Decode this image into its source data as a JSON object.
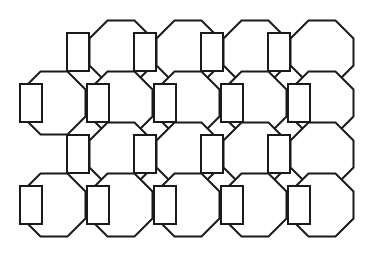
{
  "figure": {
    "name": "truncated-square-tiling",
    "background_color": "#ffffff",
    "stroke_color": "#1a1a1a",
    "fill_color": "#ffffff",
    "stroke_width": 2,
    "canvas": {
      "width": 367,
      "height": 260
    }
  },
  "geometry": {
    "unit_pitch_x": 66.8,
    "unit_pitch_y": 50.4,
    "square_width": 22,
    "square_height": 38,
    "octagon_width": 63,
    "octagon_height": 63,
    "octagon_flat_run": 27,
    "octagon_bevel": 18,
    "origin_x": 20,
    "origin_y": 18,
    "row_offsets": [
      33.4,
      0,
      33.4,
      0
    ],
    "row_square_counts": [
      4,
      5,
      4,
      5
    ],
    "row_octagon_counts": [
      4,
      5,
      4,
      5
    ]
  },
  "tiles": {
    "octagon_rows": [
      {
        "row_index": 0,
        "label": "octagon-row-1",
        "centers_y": 52,
        "centers_x": [
          121,
          188,
          255,
          322
        ]
      },
      {
        "row_index": 1,
        "label": "octagon-row-2",
        "centers_y": 103,
        "centers_x": [
          54,
          121,
          188,
          255,
          322
        ]
      },
      {
        "row_index": 2,
        "label": "octagon-row-3",
        "centers_y": 154,
        "centers_x": [
          121,
          188,
          255,
          322
        ]
      },
      {
        "row_index": 3,
        "label": "octagon-row-4",
        "centers_y": 205,
        "centers_x": [
          54,
          121,
          188,
          255,
          322
        ]
      }
    ],
    "square_rows": [
      {
        "row_index": 0,
        "label": "square-row-1",
        "centers_y": 52,
        "centers_x": [
          78,
          145,
          212,
          279
        ]
      },
      {
        "row_index": 1,
        "label": "square-row-2",
        "centers_y": 103,
        "centers_x": [
          31,
          98,
          165,
          232,
          299
        ]
      },
      {
        "row_index": 2,
        "label": "square-row-3",
        "centers_y": 154,
        "centers_x": [
          78,
          145,
          212,
          279
        ]
      },
      {
        "row_index": 3,
        "label": "square-row-4",
        "centers_y": 205,
        "centers_x": [
          31,
          98,
          165,
          232,
          299
        ]
      }
    ]
  },
  "counts": {
    "octagons_total": 18,
    "squares_total": 18
  }
}
